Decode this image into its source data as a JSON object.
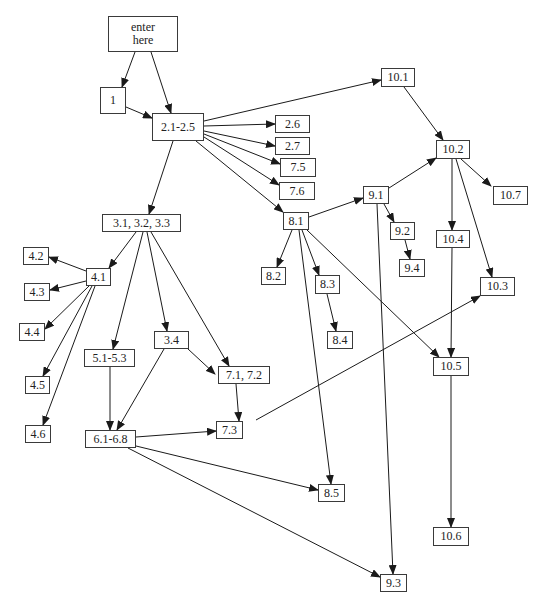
{
  "diagram": {
    "colors": {
      "line": "#1a1a1a",
      "border": "#3a3a3a",
      "text": "#222222",
      "background": "#ffffff"
    },
    "nodes": [
      {
        "id": "enter",
        "label": "enter\nhere",
        "x": 108,
        "y": 16,
        "w": 70,
        "h": 36
      },
      {
        "id": "n1",
        "label": "1",
        "x": 100,
        "y": 87,
        "w": 26,
        "h": 27
      },
      {
        "id": "n2_1_2_5",
        "label": "2.1-2.5",
        "x": 152,
        "y": 113,
        "w": 52,
        "h": 28
      },
      {
        "id": "n2_6",
        "label": "2.6",
        "x": 275,
        "y": 115,
        "w": 35,
        "h": 18
      },
      {
        "id": "n2_7",
        "label": "2.7",
        "x": 275,
        "y": 137,
        "w": 35,
        "h": 18
      },
      {
        "id": "n7_5",
        "label": "7.5",
        "x": 280,
        "y": 158,
        "w": 36,
        "h": 19
      },
      {
        "id": "n7_6",
        "label": "7.6",
        "x": 279,
        "y": 182,
        "w": 36,
        "h": 18
      },
      {
        "id": "n10_1",
        "label": "10.1",
        "x": 381,
        "y": 68,
        "w": 34,
        "h": 19
      },
      {
        "id": "n10_2",
        "label": "10.2",
        "x": 436,
        "y": 140,
        "w": 34,
        "h": 19
      },
      {
        "id": "n10_7",
        "label": "10.7",
        "x": 493,
        "y": 186,
        "w": 35,
        "h": 19
      },
      {
        "id": "n9_1",
        "label": "9.1",
        "x": 363,
        "y": 186,
        "w": 26,
        "h": 18
      },
      {
        "id": "n8_1",
        "label": "8.1",
        "x": 283,
        "y": 212,
        "w": 26,
        "h": 18
      },
      {
        "id": "n9_2",
        "label": "9.2",
        "x": 390,
        "y": 222,
        "w": 25,
        "h": 18
      },
      {
        "id": "n9_4",
        "label": "9.4",
        "x": 399,
        "y": 259,
        "w": 26,
        "h": 18
      },
      {
        "id": "n10_4",
        "label": "10.4",
        "x": 436,
        "y": 230,
        "w": 34,
        "h": 18
      },
      {
        "id": "n10_3",
        "label": "10.3",
        "x": 480,
        "y": 277,
        "w": 35,
        "h": 19
      },
      {
        "id": "n3_1_3_3",
        "label": "3.1, 3.2, 3.3",
        "x": 102,
        "y": 214,
        "w": 79,
        "h": 18
      },
      {
        "id": "n4_2",
        "label": "4.2",
        "x": 23,
        "y": 247,
        "w": 26,
        "h": 18
      },
      {
        "id": "n4_1",
        "label": "4.1",
        "x": 86,
        "y": 268,
        "w": 25,
        "h": 18
      },
      {
        "id": "n4_3",
        "label": "4.3",
        "x": 24,
        "y": 283,
        "w": 26,
        "h": 18
      },
      {
        "id": "n4_4",
        "label": "4.4",
        "x": 19,
        "y": 323,
        "w": 26,
        "h": 18
      },
      {
        "id": "n4_5",
        "label": "4.5",
        "x": 25,
        "y": 376,
        "w": 25,
        "h": 18
      },
      {
        "id": "n4_6",
        "label": "4.6",
        "x": 25,
        "y": 425,
        "w": 26,
        "h": 18
      },
      {
        "id": "n8_2",
        "label": "8.2",
        "x": 261,
        "y": 267,
        "w": 25,
        "h": 18
      },
      {
        "id": "n8_3",
        "label": "8.3",
        "x": 315,
        "y": 275,
        "w": 25,
        "h": 19
      },
      {
        "id": "n8_4",
        "label": "8.4",
        "x": 327,
        "y": 331,
        "w": 26,
        "h": 18
      },
      {
        "id": "n3_4",
        "label": "3.4",
        "x": 154,
        "y": 331,
        "w": 35,
        "h": 18
      },
      {
        "id": "n5_1_5_3",
        "label": "5.1-5.3",
        "x": 84,
        "y": 349,
        "w": 51,
        "h": 18
      },
      {
        "id": "n7_1_7_2",
        "label": "7.1, 7.2",
        "x": 218,
        "y": 366,
        "w": 52,
        "h": 18
      },
      {
        "id": "n10_5",
        "label": "10.5",
        "x": 433,
        "y": 357,
        "w": 36,
        "h": 19
      },
      {
        "id": "n7_3",
        "label": "7.3",
        "x": 216,
        "y": 421,
        "w": 27,
        "h": 18
      },
      {
        "id": "n6_1_6_8",
        "label": "6.1-6.8",
        "x": 85,
        "y": 430,
        "w": 51,
        "h": 18
      },
      {
        "id": "n8_5",
        "label": "8.5",
        "x": 318,
        "y": 484,
        "w": 27,
        "h": 18
      },
      {
        "id": "n10_6",
        "label": "10.6",
        "x": 433,
        "y": 527,
        "w": 36,
        "h": 19
      },
      {
        "id": "n9_3",
        "label": "9.3",
        "x": 380,
        "y": 574,
        "w": 27,
        "h": 18
      }
    ],
    "edges": [
      {
        "from": "enter",
        "to": "n1",
        "x1": 135,
        "y1": 52,
        "x2": 122,
        "y2": 87
      },
      {
        "from": "enter",
        "to": "n2_1_2_5",
        "x1": 151,
        "y1": 52,
        "x2": 171,
        "y2": 113
      },
      {
        "from": "n1",
        "to": "n2_1_2_5",
        "x1": 126,
        "y1": 107,
        "x2": 152,
        "y2": 118
      },
      {
        "from": "n2_1_2_5",
        "to": "n10_1",
        "x1": 204,
        "y1": 121,
        "x2": 381,
        "y2": 80
      },
      {
        "from": "n2_1_2_5",
        "to": "n2_6",
        "x1": 204,
        "y1": 126,
        "x2": 275,
        "y2": 124
      },
      {
        "from": "n2_1_2_5",
        "to": "n2_7",
        "x1": 204,
        "y1": 131,
        "x2": 275,
        "y2": 146
      },
      {
        "from": "n2_1_2_5",
        "to": "n7_5",
        "x1": 204,
        "y1": 134,
        "x2": 280,
        "y2": 164
      },
      {
        "from": "n2_1_2_5",
        "to": "n7_6",
        "x1": 204,
        "y1": 137,
        "x2": 279,
        "y2": 185
      },
      {
        "from": "n2_1_2_5",
        "to": "n8_1",
        "x1": 196,
        "y1": 141,
        "x2": 283,
        "y2": 212
      },
      {
        "from": "n2_1_2_5",
        "to": "n3_1_3_3",
        "x1": 173,
        "y1": 141,
        "x2": 149,
        "y2": 214
      },
      {
        "from": "n10_1",
        "to": "n10_2",
        "x1": 404,
        "y1": 87,
        "x2": 443,
        "y2": 140
      },
      {
        "from": "n10_2",
        "to": "n10_7",
        "x1": 461,
        "y1": 159,
        "x2": 491,
        "y2": 186
      },
      {
        "from": "n10_2",
        "to": "n10_4",
        "x1": 452,
        "y1": 159,
        "x2": 452,
        "y2": 230
      },
      {
        "from": "n10_2",
        "to": "n10_3",
        "x1": 456,
        "y1": 159,
        "x2": 492,
        "y2": 277
      },
      {
        "from": "n9_1",
        "to": "n10_2",
        "x1": 389,
        "y1": 188,
        "x2": 436,
        "y2": 158
      },
      {
        "from": "n8_1",
        "to": "n9_1",
        "x1": 309,
        "y1": 217,
        "x2": 363,
        "y2": 198
      },
      {
        "from": "n9_1",
        "to": "n9_2",
        "x1": 384,
        "y1": 204,
        "x2": 394,
        "y2": 222
      },
      {
        "from": "n9_2",
        "to": "n9_4",
        "x1": 405,
        "y1": 240,
        "x2": 410,
        "y2": 259
      },
      {
        "from": "n9_1",
        "to": "n9_3",
        "x1": 377,
        "y1": 204,
        "x2": 393,
        "y2": 574
      },
      {
        "from": "n8_1",
        "to": "n8_2",
        "x1": 292,
        "y1": 230,
        "x2": 277,
        "y2": 267
      },
      {
        "from": "n8_1",
        "to": "n8_3",
        "x1": 302,
        "y1": 230,
        "x2": 319,
        "y2": 275
      },
      {
        "from": "n8_1",
        "to": "n8_5",
        "x1": 299,
        "y1": 230,
        "x2": 331,
        "y2": 484
      },
      {
        "from": "n8_1",
        "to": "n10_5",
        "x1": 307,
        "y1": 230,
        "x2": 439,
        "y2": 357
      },
      {
        "from": "n8_3",
        "to": "n8_4",
        "x1": 327,
        "y1": 294,
        "x2": 336,
        "y2": 331
      },
      {
        "from": "n10_4",
        "to": "n10_5",
        "x1": 452,
        "y1": 248,
        "x2": 451,
        "y2": 357
      },
      {
        "from": "n10_5",
        "to": "n10_6",
        "x1": 451,
        "y1": 376,
        "x2": 451,
        "y2": 527
      },
      {
        "from": "n7_3",
        "to": "n10_3",
        "x1": 256,
        "y1": 420,
        "x2": 480,
        "y2": 296
      },
      {
        "from": "n3_1_3_3",
        "to": "n4_1",
        "x1": 136,
        "y1": 232,
        "x2": 109,
        "y2": 268
      },
      {
        "from": "n3_1_3_3",
        "to": "n5_1_5_3",
        "x1": 143,
        "y1": 232,
        "x2": 113,
        "y2": 349
      },
      {
        "from": "n3_1_3_3",
        "to": "n3_4",
        "x1": 147,
        "y1": 232,
        "x2": 167,
        "y2": 331
      },
      {
        "from": "n3_1_3_3",
        "to": "n7_1_7_2",
        "x1": 151,
        "y1": 232,
        "x2": 229,
        "y2": 366
      },
      {
        "from": "n4_1",
        "to": "n4_2",
        "x1": 86,
        "y1": 271,
        "x2": 49,
        "y2": 257
      },
      {
        "from": "n4_1",
        "to": "n4_3",
        "x1": 86,
        "y1": 281,
        "x2": 50,
        "y2": 290
      },
      {
        "from": "n4_1",
        "to": "n4_4",
        "x1": 89,
        "y1": 286,
        "x2": 45,
        "y2": 329
      },
      {
        "from": "n4_1",
        "to": "n4_5",
        "x1": 92,
        "y1": 286,
        "x2": 43,
        "y2": 376
      },
      {
        "from": "n4_1",
        "to": "n4_6",
        "x1": 95,
        "y1": 286,
        "x2": 43,
        "y2": 425
      },
      {
        "from": "n3_4",
        "to": "n6_1_6_8",
        "x1": 164,
        "y1": 349,
        "x2": 117,
        "y2": 430
      },
      {
        "from": "n3_4",
        "to": "n7_1_7_2",
        "x1": 188,
        "y1": 349,
        "x2": 215,
        "y2": 374
      },
      {
        "from": "n5_1_5_3",
        "to": "n6_1_6_8",
        "x1": 110,
        "y1": 367,
        "x2": 110,
        "y2": 430
      },
      {
        "from": "n7_1_7_2",
        "to": "n7_3",
        "x1": 236,
        "y1": 384,
        "x2": 239,
        "y2": 421
      },
      {
        "from": "n6_1_6_8",
        "to": "n7_3",
        "x1": 136,
        "y1": 437,
        "x2": 216,
        "y2": 431
      },
      {
        "from": "n6_1_6_8",
        "to": "n8_5",
        "x1": 136,
        "y1": 446,
        "x2": 318,
        "y2": 490
      },
      {
        "from": "n6_1_6_8",
        "to": "n9_3",
        "x1": 128,
        "y1": 448,
        "x2": 380,
        "y2": 577
      }
    ]
  }
}
